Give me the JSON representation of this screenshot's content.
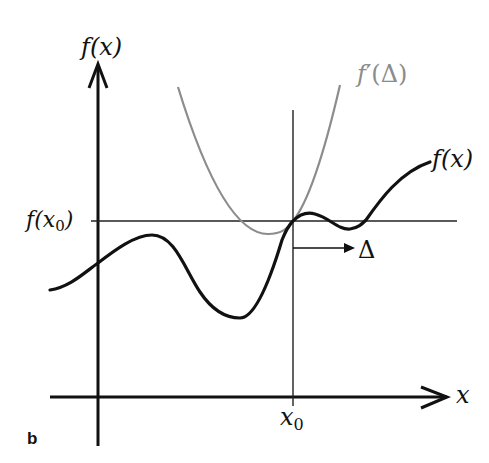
{
  "figure": {
    "panel_label": "b",
    "colors": {
      "axis": "#111111",
      "function_curve": "#111111",
      "derivative_curve": "#8c8c8c",
      "reference_lines": "#222222",
      "background": "#ffffff"
    },
    "axes": {
      "y_label": "f(x)",
      "x_label": "x"
    },
    "annotations": {
      "x0_tick_label": "x",
      "x0_tick_subscript": "0",
      "fx0_label_prefix": "f(x",
      "fx0_label_subscript": "0",
      "fx0_label_suffix": ")",
      "delta_arrow_label": "Δ"
    },
    "curves": [
      {
        "name": "f(x)",
        "label": "f(x)",
        "color": "#111111",
        "style": "solid, thick"
      },
      {
        "name": "f'(Δ)",
        "label_prefix": "f",
        "label_prime": "′",
        "label_suffix": "(Δ)",
        "color": "#8c8c8c",
        "style": "solid, thin"
      }
    ]
  }
}
